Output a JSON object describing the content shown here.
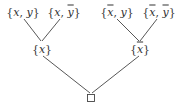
{
  "diagram": {
    "type": "tree",
    "nodes": {
      "leaf_1": {
        "open": "{",
        "a": "x",
        "a_bar": false,
        "sep": ", ",
        "b": "y",
        "b_bar": false,
        "close": "}"
      },
      "leaf_2": {
        "open": "{",
        "a": "x",
        "a_bar": false,
        "sep": ", ",
        "b": "y",
        "b_bar": true,
        "close": "}"
      },
      "leaf_3": {
        "open": "{",
        "a": "x",
        "a_bar": true,
        "sep": ", ",
        "b": "y",
        "b_bar": false,
        "close": "}"
      },
      "leaf_4": {
        "open": "{",
        "a": "x",
        "a_bar": true,
        "sep": ", ",
        "b": "y",
        "b_bar": true,
        "close": "}"
      },
      "mid_left": {
        "open": "{",
        "a": "x",
        "a_bar": false,
        "close": "}"
      },
      "mid_right": {
        "open": "{",
        "a": "x",
        "a_bar": true,
        "close": "}"
      },
      "root": {
        "symbol": "□"
      }
    },
    "edges": [
      [
        "leaf_1",
        "mid_left"
      ],
      [
        "leaf_2",
        "mid_left"
      ],
      [
        "leaf_3",
        "mid_right"
      ],
      [
        "leaf_4",
        "mid_right"
      ],
      [
        "mid_left",
        "root"
      ],
      [
        "mid_right",
        "root"
      ]
    ]
  }
}
